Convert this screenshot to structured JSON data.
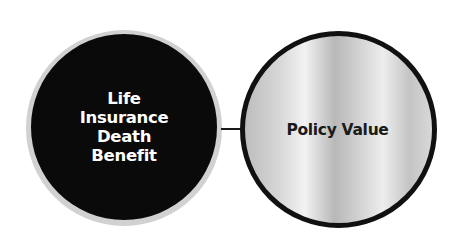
{
  "diagram": {
    "left_circle": {
      "label_lines": [
        "Life",
        "Insurance",
        "Death",
        "Benefit"
      ],
      "fill_color": "#0a0a0a",
      "text_color": "#ffffff"
    },
    "right_circle": {
      "label": "Policy Value",
      "border_color": "#111111",
      "text_color": "#1a1a1a"
    },
    "connector": {
      "from": "Life Insurance Death Benefit",
      "to": "Policy Value"
    }
  }
}
